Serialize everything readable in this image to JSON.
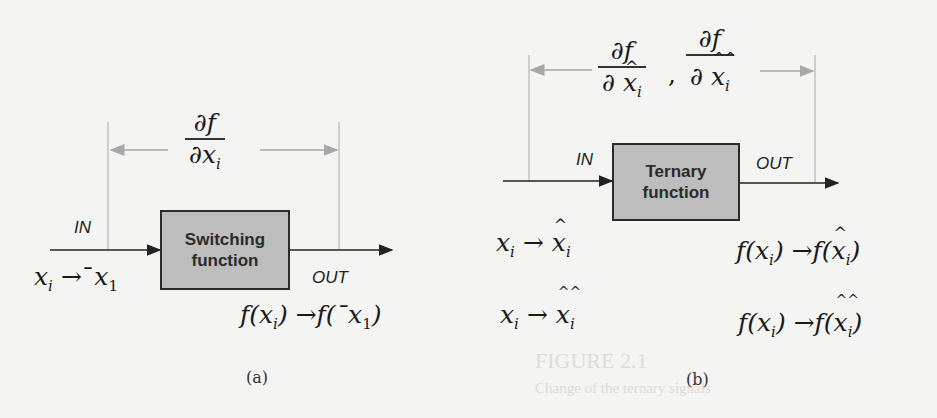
{
  "figure_a": {
    "block_label_line1": "Switching",
    "block_label_line2": "function",
    "in_label": "IN",
    "out_label": "OUT",
    "derivative": {
      "numerator": "∂f",
      "denominator_prefix": "∂",
      "denominator_var": "x",
      "denominator_sub": "i"
    },
    "input_mapping": {
      "from": "x",
      "from_sub": "i",
      "arrow": "→",
      "to_prefix": "¯",
      "to": "x",
      "to_sub": "1"
    },
    "output_mapping": {
      "text_from": "f(x",
      "from_sub": "i",
      "close": ")",
      "arrow": "→",
      "to_open": "f(¯x",
      "to_sub": "1",
      "to_close": ")"
    },
    "caption": "(a)"
  },
  "figure_b": {
    "block_label_line1": "Ternary",
    "block_label_line2": "function",
    "in_label": "IN",
    "out_label": "OUT",
    "derivative_1": {
      "numerator": "∂f",
      "denominator_prefix": "∂",
      "hat": "^",
      "denominator_var": "x",
      "denominator_sub": "i"
    },
    "separator": ",",
    "derivative_2": {
      "numerator": "∂f",
      "denominator_prefix": "∂",
      "hat": "^^",
      "denominator_var": "x",
      "denominator_sub": "i"
    },
    "input_mapping_1": {
      "from": "x",
      "from_sub": "i",
      "arrow": "→",
      "hat": "^",
      "to": "x",
      "to_sub": "i"
    },
    "input_mapping_2": {
      "from": "x",
      "from_sub": "i",
      "arrow": "→",
      "hat": "^^",
      "to": "x",
      "to_sub": "i"
    },
    "output_mapping_1": {
      "text_from": "f(x",
      "from_sub": "i",
      "close": ")",
      "arrow": "→",
      "to_open": "f(",
      "hat": "^",
      "to": "x",
      "to_sub": "i",
      "to_close": ")"
    },
    "output_mapping_2": {
      "text_from": "f(x",
      "from_sub": "i",
      "close": ")",
      "arrow": "→",
      "to_open": "f(",
      "hat": "^^",
      "to": "x",
      "to_sub": "i",
      "to_close": ")"
    },
    "caption": "(b)"
  },
  "background_ghost_text": {
    "line1": "FIGURE 2.1",
    "line2": "Change of the ternary signals"
  },
  "colors": {
    "block_fill": "#bdbdbd",
    "block_border": "#2b2b2b",
    "dimension_line": "#a8a8a8",
    "signal_line": "#222222",
    "background": "#f4f4f2"
  }
}
